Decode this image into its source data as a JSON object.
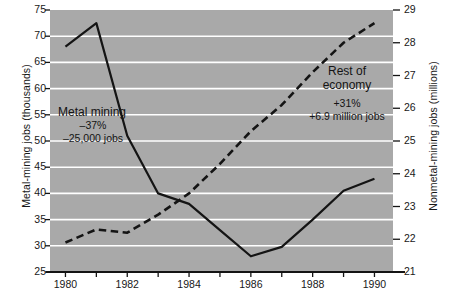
{
  "chart_data": {
    "type": "line",
    "title": "",
    "xlabel": "",
    "grid": "horizontal-white",
    "legend": "inline-annotations",
    "x": [
      1980,
      1981,
      1982,
      1983,
      1984,
      1985,
      1986,
      1987,
      1988,
      1989,
      1990
    ],
    "xlim": [
      1979.5,
      1990.6
    ],
    "xticks_major": [
      "1980",
      "1982",
      "1984",
      "1986",
      "1988",
      "1990"
    ],
    "xticks_minor": [
      "1981",
      "1983",
      "1985",
      "1987",
      "1989"
    ],
    "left_axis": {
      "label": "Metal-mining jobs (thousands)",
      "ylim": [
        25,
        75
      ],
      "ticks": [
        "25",
        "30",
        "35",
        "40",
        "45",
        "50",
        "55",
        "60",
        "65",
        "70",
        "75"
      ]
    },
    "right_axis": {
      "label": "Nonmetal-mining jobs (millions)",
      "ylim": [
        21,
        29
      ],
      "ticks": [
        "21",
        "22",
        "23",
        "24",
        "25",
        "26",
        "27",
        "28",
        "29"
      ]
    },
    "series": [
      {
        "name": "Metal mining",
        "axis": "left",
        "style": "solid",
        "color": "#141414",
        "values": [
          68.0,
          72.5,
          51.0,
          40.0,
          38.0,
          33.0,
          28.0,
          29.8,
          35.0,
          40.5,
          42.8
        ]
      },
      {
        "name": "Rest of economy",
        "axis": "right",
        "style": "dashed",
        "color": "#141414",
        "values": [
          21.9,
          22.3,
          22.2,
          22.75,
          23.4,
          24.3,
          25.3,
          26.1,
          27.1,
          28.0,
          28.6
        ]
      }
    ],
    "annotations": [
      {
        "id": "metal-mining",
        "header": "Metal mining",
        "line1": "–37%",
        "line2": "–25,000 jobs"
      },
      {
        "id": "rest-of-economy",
        "header_line1": "Rest of",
        "header_line2": "economy",
        "line1": "+31%",
        "line2": "+6.9 million jobs"
      }
    ]
  }
}
